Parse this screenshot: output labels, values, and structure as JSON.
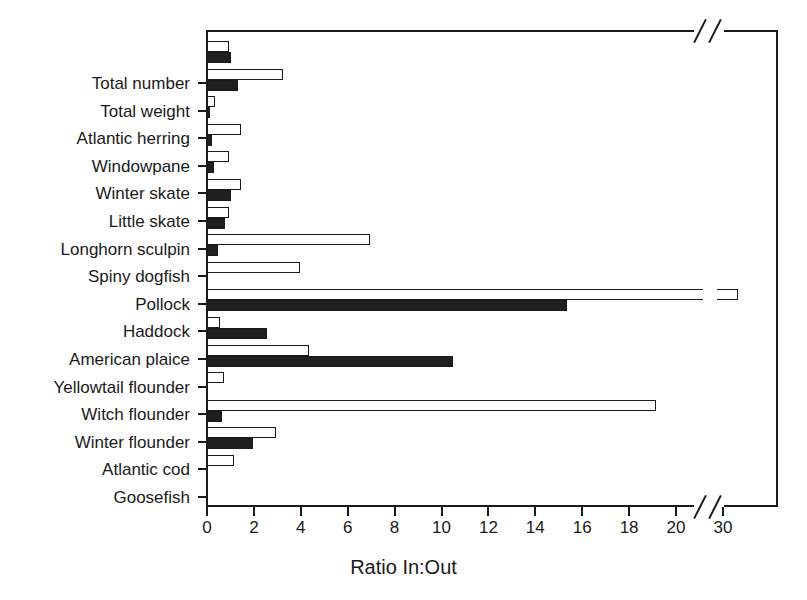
{
  "chart_data": {
    "type": "bar",
    "title": "",
    "subtitle": "",
    "orientation": "horizontal",
    "xlabel": "Ratio In:Out",
    "ylabel": "",
    "xlim": [
      0,
      34
    ],
    "grid": false,
    "legend": "none",
    "axis_break": {
      "after": 20,
      "resumes_at": 30,
      "note": "x-axis is broken between 20 and 30"
    },
    "xticks": [
      0,
      2,
      4,
      6,
      8,
      10,
      12,
      14,
      16,
      18,
      20,
      30
    ],
    "xticklabels": [
      "0",
      "2",
      "4",
      "6",
      "8",
      "10",
      "12",
      "14",
      "16",
      "18",
      "20",
      "30"
    ],
    "categories": [
      "Total number",
      "Total weight",
      "Atlantic herring",
      "Windowpane",
      "Winter skate",
      "Little skate",
      "Longhorn sculpin",
      "Spiny dogfish",
      "Pollock",
      "Haddock",
      "American plaice",
      "Yellowtail flounder",
      "Witch flounder",
      "Winter flounder",
      "Atlantic cod",
      "Goosefish"
    ],
    "series": [
      {
        "name": "open-bar",
        "fill": "white",
        "values": [
          1.0,
          3.3,
          0.4,
          1.5,
          1.0,
          1.5,
          1.0,
          7.0,
          4.0,
          33.5,
          0.6,
          4.4,
          0.75,
          19.2,
          3.0,
          1.2
        ]
      },
      {
        "name": "filled-bar",
        "fill": "black",
        "values": [
          1.05,
          1.35,
          0.1,
          0.25,
          0.35,
          1.05,
          0.8,
          0.5,
          0.0,
          15.4,
          2.6,
          10.55,
          0.0,
          0.7,
          2.0,
          0.0
        ]
      }
    ],
    "colors": {
      "open": "#ffffff",
      "filled": "#1f1f1f",
      "axis": "#1a1a1a",
      "background": "#ffffff"
    }
  }
}
